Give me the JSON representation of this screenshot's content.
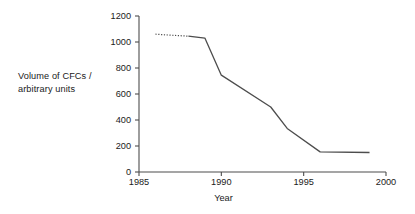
{
  "chart_data": {
    "type": "line",
    "title": "",
    "xlabel": "Year",
    "ylabel": "Volume of CFCs /\narbitrary units",
    "ylabel_line1": "Volume of CFCs /",
    "ylabel_line2": "arbitrary units",
    "xlim": [
      1985,
      2000
    ],
    "ylim": [
      0,
      1200
    ],
    "xticks": [
      1985,
      1990,
      1995,
      2000
    ],
    "xtick_labels": [
      "1985",
      "1990",
      "1995",
      "2000"
    ],
    "yticks": [
      0,
      200,
      400,
      600,
      800,
      1000,
      1200
    ],
    "ytick_labels": [
      "0",
      "200",
      "400",
      "600",
      "800",
      "1000",
      "1200"
    ],
    "grid": false,
    "legend": false,
    "line_color": "#4d4d4d",
    "axis_color": "#4d4d4d",
    "series": [
      {
        "name": "Volume of CFCs (projected)",
        "style": "dotted",
        "x": [
          1986,
          1987,
          1988
        ],
        "values": [
          1060,
          1052,
          1045
        ]
      },
      {
        "name": "Volume of CFCs (measured)",
        "style": "solid",
        "x": [
          1988,
          1989,
          1990,
          1993,
          1994,
          1996,
          1999
        ],
        "values": [
          1045,
          1030,
          745,
          500,
          335,
          155,
          150
        ]
      }
    ]
  }
}
